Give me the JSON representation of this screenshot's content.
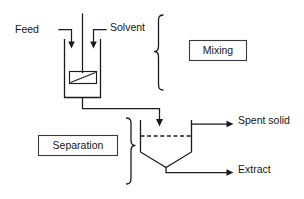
{
  "diagram": {
    "background_color": "#ffffff",
    "line_color": "#1b1b1b",
    "text_color": "#161616",
    "width": 304,
    "height": 199
  },
  "labels": {
    "feed": "Feed",
    "solvent": "Solvent",
    "mixing": "Mixing",
    "separation": "Separation",
    "spent_solid": "Spent solid",
    "extract": "Extract"
  },
  "stages": [
    {
      "name": "Mixing",
      "equipment": "agitated mixing vessel with impeller"
    },
    {
      "name": "Separation",
      "equipment": "settler with conical bottom and interface level"
    }
  ],
  "streams": [
    {
      "name": "Feed",
      "direction": "inlet",
      "target": "mixing vessel"
    },
    {
      "name": "Solvent",
      "direction": "inlet",
      "target": "mixing vessel"
    },
    {
      "name": "Spent solid",
      "direction": "outlet",
      "source": "settler upper"
    },
    {
      "name": "Extract",
      "direction": "outlet",
      "source": "settler bottom"
    }
  ]
}
